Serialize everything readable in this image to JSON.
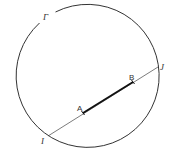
{
  "diagram": {
    "circle": {
      "label": "Γ",
      "cx": 86.5,
      "cy": 76.5,
      "r": 71.5,
      "stroke": "#333333"
    },
    "chord": {
      "from": "I",
      "to": "J",
      "stroke": "#444444"
    },
    "segment": {
      "from": "A",
      "to": "B",
      "stroke": "#111111"
    },
    "points": [
      {
        "name": "I",
        "label": "I",
        "x": 48,
        "y": 136
      },
      {
        "name": "J",
        "label": "J",
        "x": 158,
        "y": 67
      },
      {
        "name": "A",
        "label": "A",
        "x": 83,
        "y": 113
      },
      {
        "name": "B",
        "label": "B",
        "x": 133,
        "y": 82
      }
    ]
  }
}
